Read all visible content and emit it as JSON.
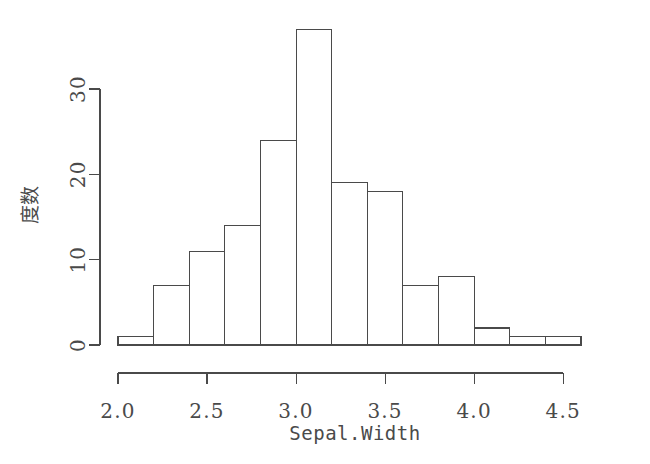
{
  "chart_data": {
    "type": "bar",
    "title": "",
    "subtitle": "",
    "xlabel": "Sepal.Width",
    "ylabel": "度数",
    "bin_width": 0.2,
    "bin_edges": [
      2.0,
      2.2,
      2.4,
      2.6,
      2.8,
      3.0,
      3.2,
      3.4,
      3.6,
      3.8,
      4.0,
      4.2,
      4.4,
      4.6
    ],
    "categories": [
      "2.0-2.2",
      "2.2-2.4",
      "2.4-2.6",
      "2.6-2.8",
      "2.8-3.0",
      "3.0-3.2",
      "3.2-3.4",
      "3.4-3.6",
      "3.6-3.8",
      "3.8-4.0",
      "4.0-4.2",
      "4.2-4.4",
      "4.4-4.6"
    ],
    "values": [
      1,
      7,
      11,
      14,
      24,
      37,
      19,
      18,
      7,
      8,
      2,
      1,
      1
    ],
    "xlim": [
      2.0,
      4.6
    ],
    "ylim": [
      0,
      37
    ],
    "xticks": [
      2.0,
      2.5,
      3.0,
      3.5,
      4.0,
      4.5
    ],
    "xtick_labels": [
      "2.0",
      "2.5",
      "3.0",
      "3.5",
      "4.0",
      "4.5"
    ],
    "yticks": [
      0,
      10,
      20,
      30
    ],
    "ytick_labels": [
      "0",
      "10",
      "20",
      "30"
    ],
    "grid": false,
    "legend": false,
    "bar_fill": "#ffffff",
    "bar_stroke": "#4a4a4a",
    "background": "#ffffff",
    "total_count": 150
  },
  "plot": {
    "x_axis_title": "Sepal.Width",
    "y_axis_title": "度数"
  }
}
